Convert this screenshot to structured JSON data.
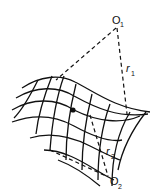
{
  "diagram": {
    "labels": {
      "center1": {
        "main": "O",
        "sub": "1"
      },
      "center2": {
        "main": "O",
        "sub": "2"
      },
      "radius1": {
        "main": "r",
        "sub": "1"
      },
      "radius2": {
        "main": "r",
        "sub": "2"
      }
    },
    "point": "surface-point"
  }
}
